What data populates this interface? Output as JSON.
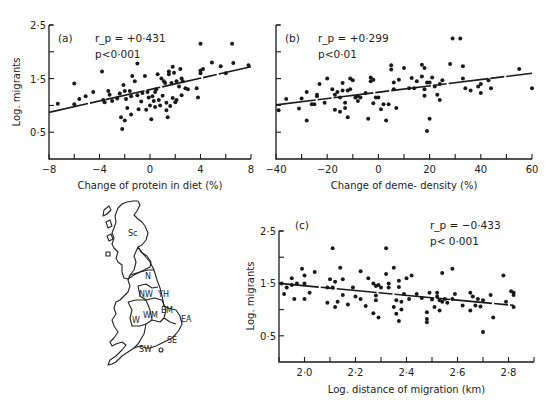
{
  "chart_data": [
    {
      "id": "a",
      "type": "scatter",
      "panel_label": "(a)",
      "annotation_r": "r_p = +0·431",
      "annotation_p": "p<0·001",
      "xlabel": "Change of protein in diet (%)",
      "ylabel": "Log. migrants",
      "xlim": [
        -8,
        8
      ],
      "ylim": [
        0,
        2.5
      ],
      "xticks": [
        -8,
        -6,
        -4,
        -2,
        0,
        2,
        4,
        6,
        8
      ],
      "xtick_labels": {
        "-8": "−8",
        "-4": "−4",
        "0": "0",
        "4": "4",
        "8": "8"
      },
      "yticks": [
        0.5,
        1.0,
        1.5,
        2.0,
        2.5
      ],
      "ytick_labels": {
        "0.5": "0·5",
        "1.5": "1·5",
        "2.5": "2·5"
      },
      "fit_line": {
        "x": [
          -8,
          8
        ],
        "y": [
          0.87,
          1.72
        ],
        "style": "dashed-mixed"
      },
      "points": [
        [
          -7.3,
          1.03
        ],
        [
          -6.0,
          1.41
        ],
        [
          -6.0,
          1.02
        ],
        [
          -5.6,
          1.12
        ],
        [
          -5.1,
          1.17
        ],
        [
          -4.5,
          1.25
        ],
        [
          -3.8,
          1.63
        ],
        [
          -3.7,
          1.1
        ],
        [
          -3.6,
          1.06
        ],
        [
          -3.3,
          1.27
        ],
        [
          -3.2,
          1.2
        ],
        [
          -3.0,
          1.08
        ],
        [
          -2.6,
          1.13
        ],
        [
          -2.4,
          1.22
        ],
        [
          -2.3,
          0.78
        ],
        [
          -2.2,
          0.56
        ],
        [
          -2.1,
          1.38
        ],
        [
          -2.0,
          1.27
        ],
        [
          -2.0,
          0.72
        ],
        [
          -1.9,
          1.12
        ],
        [
          -1.8,
          0.95
        ],
        [
          -1.6,
          1.27
        ],
        [
          -1.5,
          0.83
        ],
        [
          -1.5,
          1.17
        ],
        [
          -1.4,
          1.55
        ],
        [
          -1.2,
          1.45
        ],
        [
          -1.0,
          1.78
        ],
        [
          -1.0,
          1.19
        ],
        [
          -0.9,
          0.93
        ],
        [
          -0.7,
          1.07
        ],
        [
          -0.6,
          1.23
        ],
        [
          -0.4,
          1.55
        ],
        [
          -0.3,
          0.92
        ],
        [
          -0.2,
          1.25
        ],
        [
          -0.1,
          1.15
        ],
        [
          0.0,
          1.0
        ],
        [
          0.1,
          0.74
        ],
        [
          0.2,
          1.17
        ],
        [
          0.3,
          1.08
        ],
        [
          0.4,
          1.25
        ],
        [
          0.4,
          0.97
        ],
        [
          0.5,
          1.3
        ],
        [
          0.6,
          1.58
        ],
        [
          0.7,
          1.1
        ],
        [
          0.8,
          1.0
        ],
        [
          0.9,
          1.5
        ],
        [
          1.0,
          1.18
        ],
        [
          1.1,
          1.45
        ],
        [
          1.2,
          1.42
        ],
        [
          1.3,
          0.91
        ],
        [
          1.3,
          1.05
        ],
        [
          1.4,
          0.78
        ],
        [
          1.5,
          1.63
        ],
        [
          1.5,
          1.58
        ],
        [
          1.6,
          0.99
        ],
        [
          1.7,
          1.42
        ],
        [
          1.8,
          1.72
        ],
        [
          1.8,
          1.14
        ],
        [
          1.9,
          1.61
        ],
        [
          2.0,
          1.06
        ],
        [
          2.1,
          1.45
        ],
        [
          2.1,
          1.1
        ],
        [
          2.3,
          1.35
        ],
        [
          2.4,
          1.68
        ],
        [
          2.5,
          1.5
        ],
        [
          2.5,
          1.19
        ],
        [
          2.6,
          1.45
        ],
        [
          2.8,
          1.32
        ],
        [
          3.0,
          1.3
        ],
        [
          3.7,
          1.32
        ],
        [
          3.8,
          1.15
        ],
        [
          4.0,
          2.15
        ],
        [
          4.0,
          1.6
        ],
        [
          4.0,
          1.65
        ],
        [
          4.2,
          1.68
        ],
        [
          4.9,
          1.8
        ],
        [
          5.6,
          1.73
        ],
        [
          6.0,
          1.6
        ],
        [
          6.5,
          2.15
        ],
        [
          6.6,
          1.79
        ],
        [
          7.8,
          1.75
        ]
      ]
    },
    {
      "id": "b",
      "type": "scatter",
      "panel_label": "(b)",
      "annotation_r": "r_p = +0·299",
      "annotation_p": "p<0·01",
      "xlabel": "Change of deme- density (%)",
      "ylabel": "",
      "xlim": [
        -40,
        60
      ],
      "ylim": [
        0,
        2.5
      ],
      "xticks": [
        -40,
        -30,
        -20,
        -10,
        0,
        10,
        20,
        30,
        40,
        50,
        60
      ],
      "xtick_labels": {
        "-40": "−40",
        "-20": "−20",
        "0": "0",
        "20": "20",
        "40": "40",
        "60": "60"
      },
      "yticks": [
        0.5,
        1.0,
        1.5,
        2.0,
        2.5
      ],
      "fit_line": {
        "x": [
          -40,
          60
        ],
        "y": [
          1.01,
          1.6
        ],
        "style": "dashed-mixed"
      },
      "points": [
        [
          -39,
          0.91
        ],
        [
          -36,
          1.12
        ],
        [
          -31,
          0.94
        ],
        [
          -30,
          1.13
        ],
        [
          -28,
          1.25
        ],
        [
          -28,
          0.72
        ],
        [
          -26,
          1.02
        ],
        [
          -25,
          1.02
        ],
        [
          -24,
          1.2
        ],
        [
          -24,
          1.17
        ],
        [
          -23,
          1.4
        ],
        [
          -21,
          1.05
        ],
        [
          -20,
          1.5
        ],
        [
          -18,
          1.3
        ],
        [
          -17,
          1.2
        ],
        [
          -17,
          0.92
        ],
        [
          -16,
          1.25
        ],
        [
          -15,
          1.15
        ],
        [
          -15,
          0.88
        ],
        [
          -14,
          1.42
        ],
        [
          -14,
          1.28
        ],
        [
          -13,
          1.05
        ],
        [
          -13,
          0.95
        ],
        [
          -12,
          1.28
        ],
        [
          -12,
          0.78
        ],
        [
          -11,
          1.3
        ],
        [
          -11,
          1.5
        ],
        [
          -10,
          1.47
        ],
        [
          -9,
          1.15
        ],
        [
          -8,
          1.17
        ],
        [
          -8,
          1.08
        ],
        [
          -7,
          1.15
        ],
        [
          -5,
          1.23
        ],
        [
          -3,
          1.52
        ],
        [
          -3,
          1.45
        ],
        [
          -2,
          1.48
        ],
        [
          -4,
          0.75
        ],
        [
          -2,
          1.04
        ],
        [
          -1,
          1.15
        ],
        [
          0,
          1.15
        ],
        [
          1,
          0.93
        ],
        [
          2,
          1.02
        ],
        [
          3,
          0.72
        ],
        [
          4,
          1.02
        ],
        [
          5,
          1.67
        ],
        [
          5,
          1.75
        ],
        [
          6,
          1.43
        ],
        [
          6,
          1.3
        ],
        [
          7,
          0.95
        ],
        [
          8,
          1.48
        ],
        [
          10,
          1.7
        ],
        [
          12,
          1.32
        ],
        [
          13,
          1.51
        ],
        [
          14,
          1.32
        ],
        [
          15,
          1.45
        ],
        [
          17,
          1.54
        ],
        [
          17,
          1.76
        ],
        [
          18,
          1.7
        ],
        [
          18,
          1.3
        ],
        [
          18,
          1.18
        ],
        [
          19,
          1.43
        ],
        [
          19,
          0.52
        ],
        [
          20,
          0.75
        ],
        [
          20,
          1.43
        ],
        [
          21,
          1.52
        ],
        [
          22,
          1.35
        ],
        [
          23,
          1.2
        ],
        [
          24,
          1.1
        ],
        [
          24,
          1.4
        ],
        [
          25,
          1.47
        ],
        [
          28,
          1.77
        ],
        [
          29,
          2.25
        ],
        [
          32,
          2.25
        ],
        [
          33,
          1.5
        ],
        [
          33,
          1.73
        ],
        [
          34,
          1.32
        ],
        [
          36,
          1.28
        ],
        [
          39,
          1.35
        ],
        [
          40,
          1.4
        ],
        [
          40,
          1.23
        ],
        [
          43,
          1.47
        ],
        [
          44,
          1.32
        ],
        [
          55,
          1.68
        ],
        [
          60,
          1.32
        ]
      ]
    },
    {
      "id": "c",
      "type": "scatter",
      "panel_label": "(c)",
      "annotation_r": "r_p = −0·433",
      "annotation_p": "p< 0·001",
      "xlabel": "Log. distance of migration (km)",
      "ylabel": "Log. migrants",
      "xlim": [
        1.9,
        2.9
      ],
      "ylim": [
        0,
        2.5
      ],
      "xticks": [
        1.9,
        2.0,
        2.1,
        2.2,
        2.3,
        2.4,
        2.5,
        2.6,
        2.7,
        2.8,
        2.9
      ],
      "xtick_labels": {
        "2.0": "2·0",
        "2.2": "2·2",
        "2.4": "2·4",
        "2.6": "2·6",
        "2.8": "2·8"
      },
      "yticks": [
        0.5,
        1.0,
        1.5,
        2.0,
        2.5
      ],
      "ytick_labels": {
        "0.5": "0·5",
        "1.5": "1·5",
        "2.5": "2·5"
      },
      "fit_line": {
        "x": [
          1.9,
          2.82
        ],
        "y": [
          1.5,
          1.08
        ],
        "style": "dashed-mixed"
      },
      "points": [
        [
          1.91,
          1.5
        ],
        [
          1.92,
          1.3
        ],
        [
          1.93,
          1.42
        ],
        [
          1.95,
          1.47
        ],
        [
          1.95,
          1.6
        ],
        [
          1.96,
          1.2
        ],
        [
          1.97,
          1.5
        ],
        [
          1.99,
          1.78
        ],
        [
          2.0,
          1.65
        ],
        [
          2.0,
          1.5
        ],
        [
          2.0,
          1.2
        ],
        [
          2.02,
          1.32
        ],
        [
          2.04,
          1.72
        ],
        [
          2.09,
          1.42
        ],
        [
          2.09,
          1.13
        ],
        [
          2.1,
          1.58
        ],
        [
          2.11,
          2.17
        ],
        [
          2.11,
          1.42
        ],
        [
          2.12,
          1.05
        ],
        [
          2.12,
          1.53
        ],
        [
          2.13,
          1.15
        ],
        [
          2.14,
          1.8
        ],
        [
          2.15,
          1.28
        ],
        [
          2.15,
          1.58
        ],
        [
          2.17,
          1.1
        ],
        [
          2.19,
          1.42
        ],
        [
          2.2,
          1.25
        ],
        [
          2.22,
          1.73
        ],
        [
          2.22,
          1.2
        ],
        [
          2.24,
          1.07
        ],
        [
          2.25,
          1.6
        ],
        [
          2.27,
          1.5
        ],
        [
          2.27,
          0.93
        ],
        [
          2.28,
          1.45
        ],
        [
          2.28,
          1.18
        ],
        [
          2.28,
          1.27
        ],
        [
          2.29,
          0.85
        ],
        [
          2.29,
          1.47
        ],
        [
          2.3,
          1.42
        ],
        [
          2.32,
          2.17
        ],
        [
          2.32,
          1.68
        ],
        [
          2.33,
          1.5
        ],
        [
          2.33,
          1.42
        ],
        [
          2.35,
          1.8
        ],
        [
          2.35,
          1.05
        ],
        [
          2.36,
          0.92
        ],
        [
          2.36,
          1.18
        ],
        [
          2.37,
          0.78
        ],
        [
          2.37,
          1.43
        ],
        [
          2.37,
          1.55
        ],
        [
          2.38,
          1.15
        ],
        [
          2.38,
          1.0
        ],
        [
          2.39,
          1.3
        ],
        [
          2.4,
          1.6
        ],
        [
          2.41,
          1.2
        ],
        [
          2.42,
          1.65
        ],
        [
          2.44,
          1.3
        ],
        [
          2.46,
          1.22
        ],
        [
          2.48,
          0.95
        ],
        [
          2.48,
          0.82
        ],
        [
          2.48,
          0.76
        ],
        [
          2.49,
          1.32
        ],
        [
          2.5,
          1.19
        ],
        [
          2.51,
          1.05
        ],
        [
          2.52,
          1.25
        ],
        [
          2.52,
          1.32
        ],
        [
          2.53,
          0.98
        ],
        [
          2.53,
          1.18
        ],
        [
          2.54,
          1.15
        ],
        [
          2.54,
          1.7
        ],
        [
          2.55,
          1.2
        ],
        [
          2.56,
          1.13
        ],
        [
          2.58,
          1.78
        ],
        [
          2.58,
          1.2
        ],
        [
          2.59,
          1.3
        ],
        [
          2.62,
          1.08
        ],
        [
          2.65,
          1.32
        ],
        [
          2.65,
          0.98
        ],
        [
          2.66,
          1.25
        ],
        [
          2.67,
          1.08
        ],
        [
          2.68,
          1.2
        ],
        [
          2.69,
          1.06
        ],
        [
          2.7,
          1.18
        ],
        [
          2.7,
          0.57
        ],
        [
          2.73,
          1.28
        ],
        [
          2.74,
          0.85
        ],
        [
          2.78,
          1.65
        ],
        [
          2.79,
          1.15
        ],
        [
          2.81,
          1.35
        ],
        [
          2.82,
          1.28
        ],
        [
          2.82,
          1.32
        ],
        [
          2.82,
          1.05
        ]
      ]
    }
  ],
  "map": {
    "regions": [
      "Sc",
      "N",
      "NW",
      "YH",
      "EM",
      "WM",
      "W",
      "EA",
      "SE",
      "SW"
    ]
  }
}
